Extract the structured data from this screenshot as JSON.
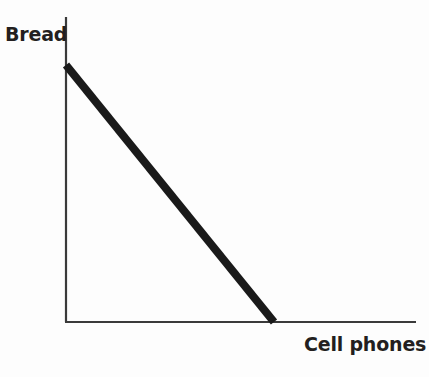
{
  "chart_data": {
    "type": "line",
    "title": "",
    "subtitle": "",
    "xlabel": "Cell phones",
    "ylabel": "Bread",
    "grid": false,
    "legend": null,
    "legend_position": "none",
    "annotations": [],
    "xlim": [
      0,
      100
    ],
    "ylim": [
      0,
      100
    ],
    "xticks": [],
    "yticks": [],
    "xticklabels": [],
    "yticklabels": [],
    "series": [
      {
        "name": "Production possibilities frontier",
        "x": [
          0,
          59.4
        ],
        "y": [
          84.3,
          0
        ],
        "color": "#1a1a1a",
        "linewidth": 8,
        "style": "solid"
      }
    ]
  },
  "figure": {
    "y_axis_label": "Bread",
    "x_axis_label": "Cell phones",
    "background_color": "#fdfdfd",
    "axis_color": "#3a3a3a",
    "line_color": "#1a1a1a",
    "label_color": "#231f20"
  }
}
